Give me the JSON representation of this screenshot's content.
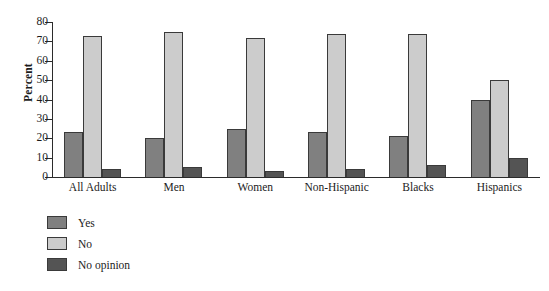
{
  "chart_data": {
    "type": "bar",
    "title": "",
    "xlabel": "",
    "ylabel": "Percent",
    "ylim": [
      0,
      80
    ],
    "yticks": [
      0,
      10,
      20,
      30,
      40,
      50,
      60,
      70,
      80
    ],
    "grid": false,
    "legend_position": "below-left",
    "categories": [
      "All Adults",
      "Men",
      "Women",
      "Non-Hispanic",
      "Blacks",
      "Hispanics"
    ],
    "series": [
      {
        "name": "Yes",
        "color": "#808080",
        "values": [
          23,
          20,
          25,
          23,
          21,
          40
        ]
      },
      {
        "name": "No",
        "color": "#cccccc",
        "values": [
          73,
          75,
          72,
          74,
          74,
          50
        ]
      },
      {
        "name": "No opinion",
        "color": "#545454",
        "values": [
          4,
          5,
          3,
          4,
          6,
          10
        ]
      }
    ]
  }
}
